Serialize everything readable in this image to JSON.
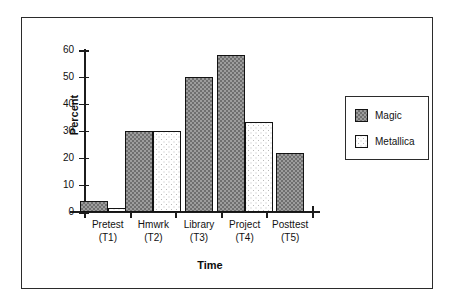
{
  "chart_data": {
    "type": "bar",
    "title": "",
    "xlabel": "Time",
    "ylabel": "Percent",
    "ylim": [
      0,
      60
    ],
    "yticks": [
      0,
      10,
      20,
      30,
      40,
      50,
      60
    ],
    "grid": false,
    "legend_position": "right",
    "categories": [
      "Pretest\n(T1)",
      "Hmwrk\n(T2)",
      "Library\n(T3)",
      "Project\n(T4)",
      "Posttest\n(T5)"
    ],
    "category_lines": [
      {
        "line1": "Pretest",
        "line2": "(T1)"
      },
      {
        "line1": "Hmwrk",
        "line2": "(T2)"
      },
      {
        "line1": "Library",
        "line2": "(T3)"
      },
      {
        "line1": "Project",
        "line2": "(T4)"
      },
      {
        "line1": "Posttest",
        "line2": "(T5)"
      }
    ],
    "series": [
      {
        "name": "Magic",
        "values": [
          4,
          30,
          50,
          58,
          22
        ]
      },
      {
        "name": "Metallica",
        "values": [
          1.5,
          30,
          0,
          33.5,
          0
        ]
      }
    ]
  },
  "legend": {
    "entries": [
      {
        "label": "Magic",
        "swatch": "dark-checker-swatch"
      },
      {
        "label": "Metallica",
        "swatch": "light-dotted-swatch"
      }
    ]
  },
  "axes": {
    "y_title": "Percent",
    "x_title": "Time",
    "y_tick_labels": [
      "60",
      "50",
      "40",
      "30",
      "20",
      "10",
      "0"
    ]
  }
}
